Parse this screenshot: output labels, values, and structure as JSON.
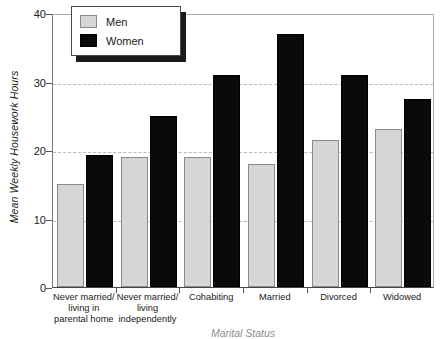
{
  "chart_data": {
    "type": "bar",
    "title": "",
    "xlabel": "Marital Status",
    "ylabel": "Mean Weekly Housework Hours",
    "ylim": [
      0,
      40
    ],
    "yticks": [
      0,
      10,
      20,
      30,
      40
    ],
    "ytick_labels": [
      "0",
      "10",
      "20",
      "30",
      "40"
    ],
    "grid": "horizontal-dashed",
    "legend_position": "top-left-inside",
    "categories": [
      "Never married/\nliving in\nparental home",
      "Never married/\nliving\nindependently",
      "Cohabiting",
      "Married",
      "Divorced",
      "Widowed"
    ],
    "category_lines": [
      [
        "Never married/",
        "living in",
        "parental home"
      ],
      [
        "Never married/",
        "living",
        "independently"
      ],
      [
        "Cohabiting"
      ],
      [
        "Married"
      ],
      [
        "Divorced"
      ],
      [
        "Widowed"
      ]
    ],
    "series": [
      {
        "name": "Men",
        "color": "#d6d6d6",
        "values": [
          15,
          19,
          19,
          18,
          21.5,
          23
        ]
      },
      {
        "name": "Women",
        "color": "#0a0a0a",
        "values": [
          19.3,
          25,
          31,
          37,
          31,
          27.5
        ]
      }
    ]
  },
  "legend": {
    "items": [
      {
        "label": "Men",
        "swatch": "men-swatch"
      },
      {
        "label": "Women",
        "swatch": "women-swatch"
      }
    ]
  },
  "axes": {
    "y_title": "Mean Weekly Housework Hours",
    "x_title": "Marital Status",
    "y_labels": [
      "40",
      "30",
      "20",
      "10",
      "0"
    ]
  }
}
